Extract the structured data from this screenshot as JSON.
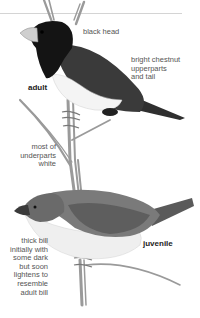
{
  "figure": {
    "colors": {
      "rule": "#d4d4d4",
      "label_text": "#555555",
      "stage_label_text": "#222222",
      "head_black": "#141414",
      "upperparts_dark": "#3a3a3a",
      "underparts_white": "#f4f4f4",
      "juvenile_back": "#7a7a7a",
      "stem": "#9a9a9a"
    }
  },
  "labels": {
    "black_head": "black head",
    "chestnut": [
      "bright chestnut",
      "upperparts",
      "and tail"
    ],
    "adult": "adult",
    "underparts": [
      "most of",
      "underparts",
      "white"
    ],
    "bill": [
      "thick bill",
      "initially with",
      "some dark",
      "but soon",
      "lightens to",
      "resemble",
      "adult bill"
    ],
    "juvenile": "juvenile"
  }
}
